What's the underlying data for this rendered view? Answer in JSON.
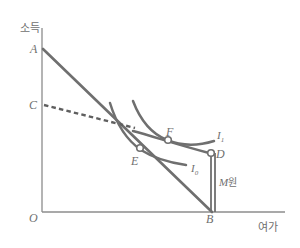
{
  "figure": {
    "kind": "economics-indifference-curve-diagram",
    "axes": {
      "y_label": "소득",
      "x_label": "여가",
      "origin_label": "O"
    },
    "points": [
      {
        "id": "A",
        "label": "A",
        "role": "budget-line-income-intercept"
      },
      {
        "id": "C",
        "label": "C",
        "role": "dashed-line-intercept"
      },
      {
        "id": "E",
        "label": "E",
        "role": "tangency-point-on-I0"
      },
      {
        "id": "F",
        "label": "F",
        "role": "tangency-point-on-I1"
      },
      {
        "id": "D",
        "label": "D",
        "role": "corner-point-on-I1"
      },
      {
        "id": "B",
        "label": "B",
        "role": "budget-line-leisure-intercept"
      }
    ],
    "curves": [
      {
        "id": "I0",
        "label": "I",
        "subscript": "0",
        "role": "lower-indifference-curve"
      },
      {
        "id": "I1",
        "label": "I",
        "subscript": "1",
        "role": "upper-indifference-curve"
      }
    ],
    "annotations": [
      {
        "id": "M",
        "label": "M",
        "unit": "원",
        "role": "vertical-transfer-bracket"
      }
    ],
    "colors": {
      "line": "#6f6f6f",
      "curve": "#6f6f6f",
      "axis": "#8c8c8c",
      "text": "#6f6f6f",
      "background": "#ffffff",
      "marker_fill": "#ffffff"
    }
  }
}
